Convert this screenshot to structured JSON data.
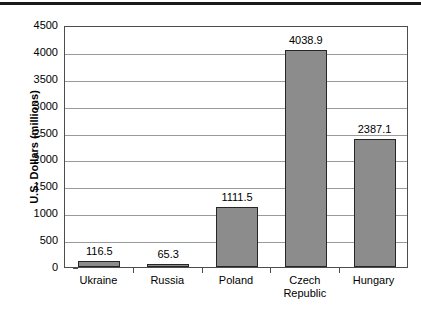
{
  "chart_data": {
    "type": "bar",
    "title": "",
    "xlabel": "",
    "ylabel": "U.S. Dollars (millions)",
    "categories": [
      "Ukraine",
      "Russia",
      "Poland",
      "Czech\nRepublic",
      "Hungary"
    ],
    "values": [
      116.5,
      65.3,
      1111.5,
      4038.9,
      2387.1
    ],
    "value_labels": [
      "116.5",
      "65.3",
      "1111.5",
      "4038.9",
      "2387.1"
    ],
    "ylim": [
      0,
      4500
    ],
    "ytick_values": [
      0,
      500,
      1000,
      1500,
      2000,
      2500,
      3000,
      3500,
      4000,
      4500
    ],
    "ytick_labels": [
      "0",
      "500",
      "1000",
      "1500",
      "2000",
      "2500",
      "3000",
      "3500",
      "4000",
      "4500"
    ],
    "grid": "horizontal",
    "legend": "none",
    "bar_color": "#8c8c8c",
    "bar_edge_color": "#262626",
    "gridline_color": "#9a9a9a",
    "axis_color": "#4d4d4d"
  }
}
